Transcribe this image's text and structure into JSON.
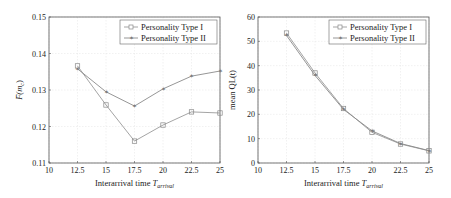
{
  "chart_data": [
    {
      "type": "line",
      "title": "",
      "xlabel": "Interarrival time T_arrival",
      "ylabel": "F̄(m_c)",
      "x": [
        12.5,
        15,
        17.5,
        20,
        22.5,
        25
      ],
      "xlim": [
        10,
        25
      ],
      "ylim": [
        0.11,
        0.15
      ],
      "xticks": [
        "10",
        "12.5",
        "15",
        "17.5",
        "20",
        "22.5",
        "25"
      ],
      "yticks": [
        "0.11",
        "0.12",
        "0.13",
        "0.14",
        "0.15"
      ],
      "grid": true,
      "legend_position": "upper right",
      "series": [
        {
          "name": "Personality Type I",
          "marker": "square",
          "color": "#9a9a9a",
          "values": [
            0.1366,
            0.1259,
            0.116,
            0.1204,
            0.124,
            0.1237
          ]
        },
        {
          "name": "Personality Type II",
          "marker": "star",
          "color": "#8a8a8a",
          "values": [
            0.1358,
            0.1295,
            0.1256,
            0.1303,
            0.1338,
            0.1352
          ]
        }
      ]
    },
    {
      "type": "line",
      "title": "",
      "xlabel": "Interarrival time T_arrival",
      "ylabel": "mean QL(t)",
      "x": [
        12.5,
        15,
        17.5,
        20,
        22.5,
        25
      ],
      "xlim": [
        10,
        25
      ],
      "ylim": [
        0,
        60
      ],
      "xticks": [
        "10",
        "12.5",
        "15",
        "17.5",
        "20",
        "22.5",
        "25"
      ],
      "yticks": [
        "0",
        "10",
        "20",
        "30",
        "40",
        "50",
        "60"
      ],
      "grid": true,
      "legend_position": "upper right",
      "series": [
        {
          "name": "Personality Type I",
          "marker": "square",
          "color": "#9a9a9a",
          "values": [
            53.4,
            37.0,
            22.4,
            12.6,
            7.8,
            5.0
          ]
        },
        {
          "name": "Personality Type II",
          "marker": "star",
          "color": "#8a8a8a",
          "values": [
            52.4,
            36.0,
            22.0,
            13.2,
            8.0,
            5.1
          ]
        }
      ]
    }
  ],
  "charts": {
    "left": {
      "xlabel_main": "Interarrival time ",
      "xlabel_var": "T",
      "xlabel_sub": "arrival",
      "ylabel_main": "F̄(m",
      "ylabel_sub": "c",
      "ylabel_close": ")",
      "legend": [
        "Personality Type I",
        "Personality Type II"
      ]
    },
    "right": {
      "xlabel_main": "Interarrival time ",
      "xlabel_var": "T",
      "xlabel_sub": "arrival",
      "ylabel": "mean QL(t)",
      "legend": [
        "Personality Type I",
        "Personality Type II"
      ]
    }
  }
}
